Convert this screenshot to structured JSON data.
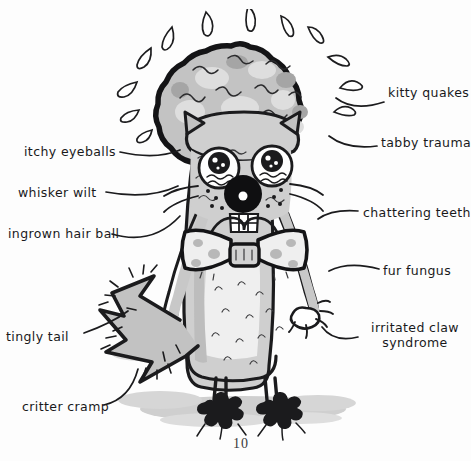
{
  "page": {
    "header_text": "hair ball.",
    "page_number": "10",
    "background_color": "#fdfdfd",
    "ink_color": "#19191b",
    "fur_gray": "#b8b8b8",
    "shadow_gray": "#c9c9c9"
  },
  "figure": {
    "parts": [
      "hair-ball",
      "sweat-droplets",
      "ears",
      "eyes",
      "nose",
      "chattering-teeth",
      "bow-tie",
      "body",
      "arms",
      "claws",
      "legs",
      "paws",
      "zigzag-tail",
      "ground-shadow"
    ]
  },
  "labels": {
    "left": [
      {
        "id": "itchy-eyeballs",
        "text": "itchy eyeballs",
        "x": 24,
        "y": 145
      },
      {
        "id": "whisker-wilt",
        "text": "whisker wilt",
        "x": 18,
        "y": 186
      },
      {
        "id": "ingrown-hair-ball",
        "text": "ingrown hair ball",
        "x": 8,
        "y": 227
      },
      {
        "id": "tingly-tail",
        "text": "tingly tail",
        "x": 6,
        "y": 330
      },
      {
        "id": "critter-cramp",
        "text": "critter cramp",
        "x": 22,
        "y": 400
      }
    ],
    "right": [
      {
        "id": "kitty-quakes",
        "text": "kitty quakes",
        "x": 388,
        "y": 86
      },
      {
        "id": "tabby-trauma",
        "text": "tabby trauma",
        "x": 381,
        "y": 136
      },
      {
        "id": "chattering-teeth",
        "text": "chattering teeth",
        "x": 363,
        "y": 206
      },
      {
        "id": "fur-fungus",
        "text": "fur fungus",
        "x": 383,
        "y": 264
      },
      {
        "id": "irritated-claw",
        "line1": "irritated claw",
        "line2": "syndrome",
        "x": 365,
        "y": 320
      }
    ]
  }
}
